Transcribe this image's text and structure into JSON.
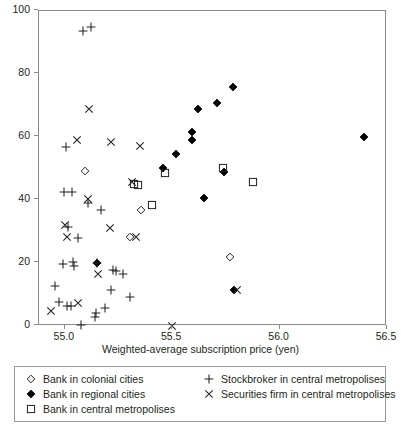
{
  "chart_data": {
    "type": "scatter",
    "title": "",
    "xlabel": "Weighted-average subscription price (yen)",
    "ylabel": "",
    "xlim": [
      54.88,
      56.5
    ],
    "ylim": [
      0,
      100
    ],
    "grid": false,
    "legend_position": "below-plot",
    "xticks": [
      "55.0",
      "55.5",
      "56.0",
      "56.5"
    ],
    "xtick_values": [
      55.0,
      55.5,
      56.0,
      56.5
    ],
    "yticks": [
      "0",
      "20",
      "40",
      "60",
      "80",
      "100"
    ],
    "ytick_values": [
      0,
      20,
      40,
      60,
      80,
      100
    ],
    "series": [
      {
        "name": "Bank in colonial cities",
        "marker": "open-diamond",
        "color": "#231f20",
        "points": [
          [
            55.095,
            49.2
          ],
          [
            55.305,
            28.2
          ],
          [
            55.355,
            36.8
          ],
          [
            55.77,
            22.0
          ]
        ]
      },
      {
        "name": "Bank in regional cities",
        "marker": "filled-diamond",
        "color": "#000000",
        "points": [
          [
            55.15,
            20.0
          ],
          [
            55.455,
            50.2
          ],
          [
            55.52,
            54.7
          ],
          [
            55.59,
            59.0
          ],
          [
            55.59,
            61.7
          ],
          [
            55.62,
            68.8
          ],
          [
            55.65,
            40.5
          ],
          [
            55.71,
            70.8
          ],
          [
            55.74,
            49.0
          ],
          [
            55.785,
            75.8
          ],
          [
            55.79,
            11.3
          ],
          [
            56.395,
            60.0
          ]
        ]
      },
      {
        "name": "Bank in central metropolises",
        "marker": "open-square",
        "color": "#231f20",
        "points": [
          [
            55.32,
            45.2
          ],
          [
            55.34,
            44.9
          ],
          [
            55.405,
            38.5
          ],
          [
            55.465,
            48.7
          ],
          [
            55.735,
            50.3
          ],
          [
            55.875,
            45.8
          ]
        ]
      },
      {
        "name": "Stockbroker in central metropolises",
        "marker": "plus",
        "color": "#231f20",
        "points": [
          [
            54.955,
            12.8
          ],
          [
            54.975,
            7.6
          ],
          [
            54.99,
            19.7
          ],
          [
            54.995,
            42.5
          ],
          [
            55.005,
            56.8
          ],
          [
            55.01,
            6.4
          ],
          [
            55.015,
            31.5
          ],
          [
            55.03,
            6.4
          ],
          [
            55.035,
            42.6
          ],
          [
            55.04,
            20.4
          ],
          [
            55.045,
            19.0
          ],
          [
            55.06,
            28.0
          ],
          [
            55.075,
            0.2
          ],
          [
            55.085,
            93.5
          ],
          [
            55.11,
            39.0
          ],
          [
            55.12,
            95.0
          ],
          [
            55.14,
            3.0
          ],
          [
            55.145,
            4.0
          ],
          [
            55.15,
            20.0
          ],
          [
            55.17,
            36.9
          ],
          [
            55.185,
            5.8
          ],
          [
            55.215,
            11.5
          ],
          [
            55.225,
            17.7
          ],
          [
            55.24,
            17.4
          ],
          [
            55.27,
            16.5
          ],
          [
            55.305,
            9.2
          ]
        ]
      },
      {
        "name": "Securities firm in central metropolises",
        "marker": "cross",
        "color": "#231f20",
        "points": [
          [
            54.935,
            4.8
          ],
          [
            55.0,
            32.1
          ],
          [
            55.01,
            28.2
          ],
          [
            55.055,
            58.9
          ],
          [
            55.06,
            7.2
          ],
          [
            55.11,
            40.3
          ],
          [
            55.115,
            68.8
          ],
          [
            55.155,
            16.6
          ],
          [
            55.21,
            31.1
          ],
          [
            55.215,
            58.5
          ],
          [
            55.315,
            45.6
          ],
          [
            55.33,
            28.3
          ],
          [
            55.35,
            57.1
          ],
          [
            55.5,
            0.0
          ],
          [
            55.8,
            11.3
          ]
        ]
      }
    ]
  },
  "legend": {
    "entries_left": [
      {
        "marker": "open-diamond",
        "label": "Bank in colonial cities"
      },
      {
        "marker": "filled-diamond",
        "label": "Bank in regional cities"
      },
      {
        "marker": "open-square",
        "label": "Bank in central metropolises"
      }
    ],
    "entries_right": [
      {
        "marker": "plus",
        "label": "Stockbroker in central metropolises"
      },
      {
        "marker": "cross",
        "label": "Securities firm in central metropolises"
      }
    ]
  }
}
